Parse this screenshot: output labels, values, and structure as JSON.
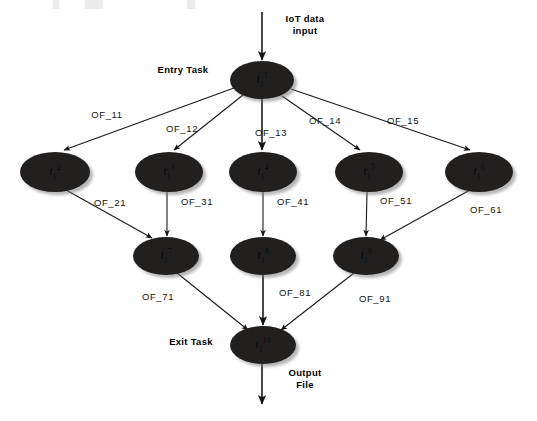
{
  "diagram": {
    "background_color": "#ffffff",
    "node_fill_color": "#221f1f",
    "edge_color": "#1a1a1a",
    "annotations": {
      "input": "IoT data\ninput",
      "entry_task": "Entry Task",
      "exit_task": "Exit Task",
      "output": "Output\nFile"
    },
    "nodes": [
      {
        "id": "t1",
        "base": "t",
        "sub": "1",
        "sup": "1",
        "x": 262,
        "y": 80,
        "rx": 32,
        "ry": 19
      },
      {
        "id": "t2",
        "base": "t",
        "sub": "1",
        "sup": "2",
        "x": 55,
        "y": 172,
        "rx": 35,
        "ry": 20
      },
      {
        "id": "t3",
        "base": "t",
        "sub": "1",
        "sup": "3",
        "x": 169,
        "y": 172,
        "rx": 34,
        "ry": 20
      },
      {
        "id": "t4",
        "base": "t",
        "sub": "1",
        "sup": "4",
        "x": 263,
        "y": 172,
        "rx": 34,
        "ry": 20
      },
      {
        "id": "t5",
        "base": "t",
        "sub": "1",
        "sup": "5",
        "x": 369,
        "y": 172,
        "rx": 34,
        "ry": 20
      },
      {
        "id": "t6",
        "base": "t",
        "sub": "1",
        "sup": "6",
        "x": 479,
        "y": 172,
        "rx": 34,
        "ry": 20
      },
      {
        "id": "t7",
        "base": "t",
        "sub": "1",
        "sup": "7",
        "x": 166,
        "y": 256,
        "rx": 33,
        "ry": 19
      },
      {
        "id": "t8",
        "base": "t",
        "sub": "1",
        "sup": "8",
        "x": 263,
        "y": 256,
        "rx": 33,
        "ry": 19
      },
      {
        "id": "t9",
        "base": "t",
        "sub": "1",
        "sup": "9",
        "x": 366,
        "y": 256,
        "rx": 33,
        "ry": 19
      },
      {
        "id": "t10",
        "base": "t",
        "sub": "1",
        "sup": "10",
        "x": 263,
        "y": 345,
        "rx": 33,
        "ry": 19
      }
    ],
    "edges": [
      {
        "id": "e_in",
        "label": "",
        "from": "input",
        "to": "t1",
        "x1": 262,
        "y1": 12,
        "x2": 262,
        "y2": 60,
        "label_x": 0,
        "label_y": 0
      },
      {
        "id": "e_11",
        "label": "OF_11",
        "from": "t1",
        "to": "t2",
        "x1": 234,
        "y1": 88,
        "x2": 64,
        "y2": 150,
        "label_x": 107,
        "label_y": 114
      },
      {
        "id": "e_12",
        "label": "OF_12",
        "from": "t1",
        "to": "t3",
        "x1": 243,
        "y1": 95,
        "x2": 174,
        "y2": 150,
        "label_x": 182,
        "label_y": 128
      },
      {
        "id": "e_13",
        "label": "OF_13",
        "from": "t1",
        "to": "t4",
        "x1": 262,
        "y1": 99,
        "x2": 262,
        "y2": 150,
        "label_x": 271,
        "label_y": 132
      },
      {
        "id": "e_14",
        "label": "OF_14",
        "from": "t1",
        "to": "t5",
        "x1": 282,
        "y1": 96,
        "x2": 360,
        "y2": 150,
        "label_x": 325,
        "label_y": 120
      },
      {
        "id": "e_15",
        "label": "OF_15",
        "from": "t1",
        "to": "t6",
        "x1": 291,
        "y1": 89,
        "x2": 470,
        "y2": 150,
        "label_x": 403,
        "label_y": 120
      },
      {
        "id": "e_21",
        "label": "OF_21",
        "from": "t2",
        "to": "t7",
        "x1": 66,
        "y1": 190,
        "x2": 152,
        "y2": 238,
        "label_x": 110,
        "label_y": 202
      },
      {
        "id": "e_31",
        "label": "OF_31",
        "from": "t3",
        "to": "t7",
        "x1": 167,
        "y1": 192,
        "x2": 167,
        "y2": 236,
        "label_x": 197,
        "label_y": 201
      },
      {
        "id": "e_41",
        "label": "OF_41",
        "from": "t4",
        "to": "t8",
        "x1": 263,
        "y1": 192,
        "x2": 263,
        "y2": 236,
        "label_x": 293,
        "label_y": 201
      },
      {
        "id": "e_51",
        "label": "OF_51",
        "from": "t5",
        "to": "t9",
        "x1": 367,
        "y1": 192,
        "x2": 366,
        "y2": 236,
        "label_x": 396,
        "label_y": 200
      },
      {
        "id": "e_61",
        "label": "OF_61",
        "from": "t6",
        "to": "t9",
        "x1": 470,
        "y1": 190,
        "x2": 380,
        "y2": 240,
        "label_x": 486,
        "label_y": 209
      },
      {
        "id": "e_71",
        "label": "OF_71",
        "from": "t7",
        "to": "t10",
        "x1": 177,
        "y1": 273,
        "x2": 248,
        "y2": 330,
        "label_x": 158,
        "label_y": 296
      },
      {
        "id": "e_81",
        "label": "OF_81",
        "from": "t8",
        "to": "t10",
        "x1": 263,
        "y1": 275,
        "x2": 263,
        "y2": 325,
        "label_x": 295,
        "label_y": 292
      },
      {
        "id": "e_91",
        "label": "OF_91",
        "from": "t9",
        "to": "t10",
        "x1": 354,
        "y1": 273,
        "x2": 281,
        "y2": 330,
        "label_x": 375,
        "label_y": 298
      },
      {
        "id": "e_out",
        "label": "",
        "from": "t10",
        "to": "output",
        "x1": 262,
        "y1": 364,
        "x2": 262,
        "y2": 404,
        "label_x": 0,
        "label_y": 0
      }
    ],
    "annotation_positions": {
      "input": {
        "x": 305,
        "y": 25
      },
      "entry_task": {
        "x": 183,
        "y": 70
      },
      "exit_task": {
        "x": 191,
        "y": 342
      },
      "output": {
        "x": 305,
        "y": 379
      }
    }
  }
}
